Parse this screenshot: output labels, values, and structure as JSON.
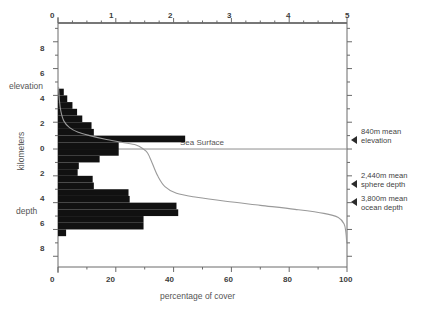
{
  "chart_data": {
    "type": "bar",
    "title": "",
    "xlabel": "percentage of cover",
    "ylabel": "kilometers",
    "orientation": "horizontal",
    "top_axis": {
      "label": "percentage of cover",
      "ticks": [
        0,
        1,
        2,
        3,
        4,
        5
      ],
      "range": [
        0,
        5
      ],
      "minor_step": 0.25
    },
    "bottom_axis": {
      "label": "percentage of cover",
      "ticks": [
        0,
        20,
        40,
        60,
        80,
        100
      ],
      "range": [
        0,
        100
      ],
      "minor_step": 10
    },
    "y_axis": {
      "label": "kilometers",
      "ticks": [
        8,
        6,
        4,
        2,
        0,
        2,
        4,
        6,
        8
      ],
      "tick_values_km": [
        8,
        6,
        4,
        2,
        0,
        -2,
        -4,
        -6,
        -8
      ],
      "range_km": [
        -8.8,
        9.4
      ],
      "upper_region_label": "elevation",
      "lower_region_label": "depth",
      "minor_step": 1
    },
    "sea_surface_label": "Sea Surface",
    "grid": false,
    "legend": false,
    "histogram": {
      "name": "percentage of Earth's surface per 0.5 km elevation band",
      "axis": "top",
      "units": "percent",
      "bins": [
        {
          "band_km": [
            4.0,
            4.5
          ],
          "value": 0.1
        },
        {
          "band_km": [
            3.5,
            4.0
          ],
          "value": 0.16
        },
        {
          "band_km": [
            3.0,
            3.5
          ],
          "value": 0.25
        },
        {
          "band_km": [
            2.5,
            3.0
          ],
          "value": 0.33
        },
        {
          "band_km": [
            2.0,
            2.5
          ],
          "value": 0.42
        },
        {
          "band_km": [
            1.5,
            2.0
          ],
          "value": 0.58
        },
        {
          "band_km": [
            1.0,
            1.5
          ],
          "value": 0.62
        },
        {
          "band_km": [
            0.5,
            1.0
          ],
          "value": 2.2
        },
        {
          "band_km": [
            0.0,
            0.5
          ],
          "value": 1.05
        },
        {
          "band_km": [
            -0.5,
            0.0
          ],
          "value": 1.05
        },
        {
          "band_km": [
            -1.0,
            -0.5
          ],
          "value": 0.72
        },
        {
          "band_km": [
            -1.5,
            -1.0
          ],
          "value": 0.36
        },
        {
          "band_km": [
            -2.0,
            -1.5
          ],
          "value": 0.34
        },
        {
          "band_km": [
            -2.5,
            -2.0
          ],
          "value": 0.6
        },
        {
          "band_km": [
            -3.0,
            -2.5
          ],
          "value": 0.62
        },
        {
          "band_km": [
            -3.5,
            -3.0
          ],
          "value": 1.22
        },
        {
          "band_km": [
            -4.0,
            -3.5
          ],
          "value": 1.24
        },
        {
          "band_km": [
            -4.5,
            -4.0
          ],
          "value": 2.05
        },
        {
          "band_km": [
            -5.0,
            -4.5
          ],
          "value": 2.08
        },
        {
          "band_km": [
            -5.5,
            -5.0
          ],
          "value": 1.48
        },
        {
          "band_km": [
            -6.0,
            -5.5
          ],
          "value": 1.48
        },
        {
          "band_km": [
            -6.5,
            -6.0
          ],
          "value": 0.14
        }
      ]
    },
    "hypsometric_curve": {
      "name": "cumulative percentage of Earth's surface",
      "axis": "bottom",
      "units": "percent",
      "points": [
        {
          "x": 0.2,
          "y_km": 4.6
        },
        {
          "x": 0.5,
          "y_km": 3.6
        },
        {
          "x": 1.0,
          "y_km": 2.8
        },
        {
          "x": 2.0,
          "y_km": 2.1
        },
        {
          "x": 4.0,
          "y_km": 1.6
        },
        {
          "x": 7.0,
          "y_km": 1.25
        },
        {
          "x": 11.0,
          "y_km": 1.0
        },
        {
          "x": 16.0,
          "y_km": 0.75
        },
        {
          "x": 22.0,
          "y_km": 0.5
        },
        {
          "x": 27.0,
          "y_km": 0.3
        },
        {
          "x": 29.5,
          "y_km": 0.0
        },
        {
          "x": 31.0,
          "y_km": -0.3
        },
        {
          "x": 32.5,
          "y_km": -1.0
        },
        {
          "x": 34.5,
          "y_km": -2.0
        },
        {
          "x": 37.0,
          "y_km": -2.8
        },
        {
          "x": 41.0,
          "y_km": -3.3
        },
        {
          "x": 48.0,
          "y_km": -3.6
        },
        {
          "x": 58.0,
          "y_km": -3.9
        },
        {
          "x": 70.0,
          "y_km": -4.2
        },
        {
          "x": 82.0,
          "y_km": -4.5
        },
        {
          "x": 92.0,
          "y_km": -4.8
        },
        {
          "x": 97.0,
          "y_km": -5.1
        },
        {
          "x": 99.0,
          "y_km": -5.6
        },
        {
          "x": 99.6,
          "y_km": -6.2
        },
        {
          "x": 99.9,
          "y_km": -7.0
        }
      ]
    },
    "annotations": [
      {
        "id": "mean-elevation",
        "line1": "840m mean",
        "line2": "elevation",
        "y_km": 0.84
      },
      {
        "id": "mean-sphere-depth",
        "line1": "2,440m mean",
        "line2": "sphere depth",
        "y_km": -2.44
      },
      {
        "id": "mean-ocean-depth",
        "line1": "3,800m mean",
        "line2": "ocean depth",
        "y_km": -3.8
      }
    ]
  }
}
